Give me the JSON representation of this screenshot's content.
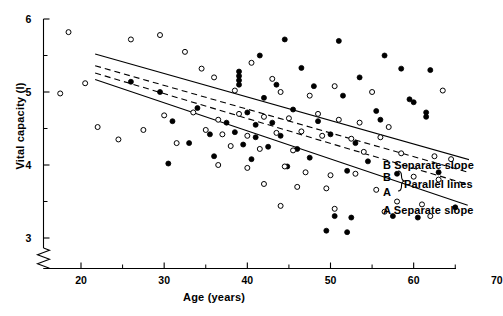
{
  "chart_data": {
    "type": "scatter",
    "title": "",
    "xlabel": "Age (years)",
    "ylabel": "Vital capacity (l)",
    "xlim": [
      15,
      70
    ],
    "ylim": [
      2.75,
      6
    ],
    "y_axis_break": true,
    "grid": false,
    "legend_position": "right-inside",
    "x_ticks_major": [
      20,
      30,
      40,
      50,
      60,
      70
    ],
    "x_ticks_minor": [
      25,
      35,
      45,
      55,
      65
    ],
    "x_tick_labels": [
      "20",
      "30",
      "40",
      "50",
      "60",
      "70"
    ],
    "y_ticks_major": [
      3,
      4,
      5,
      6
    ],
    "y_ticks_minor": [
      3.5,
      4.5,
      5.5
    ],
    "y_tick_labels": [
      "3",
      "4",
      "5",
      "6"
    ],
    "series": [
      {
        "name": "Group A",
        "marker": "filled-circle",
        "color": "#000000",
        "points": [
          [
            44.5,
            5.72
          ],
          [
            51.0,
            5.7
          ],
          [
            41.5,
            5.5
          ],
          [
            56.5,
            5.5
          ],
          [
            39.0,
            5.28
          ],
          [
            39.0,
            5.22
          ],
          [
            39.0,
            5.16
          ],
          [
            39.0,
            5.1
          ],
          [
            46.5,
            5.33
          ],
          [
            58.5,
            5.32
          ],
          [
            62.0,
            5.3
          ],
          [
            53.5,
            5.2
          ],
          [
            43.5,
            5.1
          ],
          [
            48.0,
            5.08
          ],
          [
            26.0,
            5.14
          ],
          [
            29.5,
            5.0
          ],
          [
            42.0,
            4.92
          ],
          [
            51.5,
            4.95
          ],
          [
            59.5,
            4.9
          ],
          [
            60.0,
            4.86
          ],
          [
            34.0,
            4.78
          ],
          [
            40.0,
            4.72
          ],
          [
            45.5,
            4.76
          ],
          [
            55.5,
            4.74
          ],
          [
            61.5,
            4.72
          ],
          [
            61.5,
            4.66
          ],
          [
            31.0,
            4.6
          ],
          [
            37.5,
            4.58
          ],
          [
            41.0,
            4.55
          ],
          [
            43.0,
            4.58
          ],
          [
            48.5,
            4.6
          ],
          [
            56.0,
            4.62
          ],
          [
            35.5,
            4.42
          ],
          [
            38.5,
            4.45
          ],
          [
            41.0,
            4.38
          ],
          [
            44.0,
            4.4
          ],
          [
            50.0,
            4.42
          ],
          [
            33.0,
            4.3
          ],
          [
            39.5,
            4.28
          ],
          [
            42.5,
            4.25
          ],
          [
            46.0,
            4.22
          ],
          [
            53.0,
            4.3
          ],
          [
            36.0,
            4.12
          ],
          [
            40.5,
            4.08
          ],
          [
            47.5,
            4.1
          ],
          [
            54.5,
            4.05
          ],
          [
            30.5,
            4.02
          ],
          [
            44.8,
            3.98
          ],
          [
            52.0,
            3.92
          ],
          [
            58.0,
            3.88
          ],
          [
            65.0,
            3.42
          ],
          [
            63.0,
            3.9
          ],
          [
            50.5,
            3.3
          ],
          [
            52.5,
            3.28
          ],
          [
            57.5,
            3.3
          ],
          [
            60.5,
            3.28
          ],
          [
            49.5,
            3.1
          ],
          [
            52.0,
            3.08
          ]
        ]
      },
      {
        "name": "Group B",
        "marker": "open-circle",
        "color": "#000000",
        "points": [
          [
            18.5,
            5.82
          ],
          [
            26.0,
            5.72
          ],
          [
            29.5,
            5.78
          ],
          [
            32.5,
            5.55
          ],
          [
            17.5,
            4.98
          ],
          [
            20.5,
            5.12
          ],
          [
            34.5,
            5.32
          ],
          [
            36.0,
            5.2
          ],
          [
            40.5,
            5.4
          ],
          [
            43.0,
            5.18
          ],
          [
            50.5,
            5.08
          ],
          [
            55.0,
            5.0
          ],
          [
            63.5,
            5.02
          ],
          [
            47.5,
            4.95
          ],
          [
            38.5,
            5.02
          ],
          [
            44.0,
            5.0
          ],
          [
            22.0,
            4.52
          ],
          [
            27.5,
            4.48
          ],
          [
            30.0,
            4.68
          ],
          [
            33.5,
            4.72
          ],
          [
            36.5,
            4.62
          ],
          [
            39.0,
            4.7
          ],
          [
            42.0,
            4.66
          ],
          [
            45.0,
            4.64
          ],
          [
            48.5,
            4.7
          ],
          [
            51.0,
            4.62
          ],
          [
            53.5,
            4.58
          ],
          [
            57.0,
            4.52
          ],
          [
            35.0,
            4.48
          ],
          [
            37.0,
            4.42
          ],
          [
            40.0,
            4.4
          ],
          [
            43.5,
            4.44
          ],
          [
            46.5,
            4.46
          ],
          [
            49.0,
            4.4
          ],
          [
            52.5,
            4.36
          ],
          [
            56.0,
            4.38
          ],
          [
            24.5,
            4.35
          ],
          [
            31.5,
            4.3
          ],
          [
            38.0,
            4.26
          ],
          [
            41.5,
            4.22
          ],
          [
            45.5,
            4.2
          ],
          [
            54.0,
            4.18
          ],
          [
            58.5,
            4.16
          ],
          [
            62.5,
            4.12
          ],
          [
            64.5,
            4.08
          ],
          [
            36.5,
            4.0
          ],
          [
            40.0,
            3.96
          ],
          [
            44.5,
            3.98
          ],
          [
            47.0,
            3.9
          ],
          [
            50.0,
            3.86
          ],
          [
            53.0,
            3.88
          ],
          [
            60.0,
            3.84
          ],
          [
            63.0,
            3.8
          ],
          [
            42.0,
            3.74
          ],
          [
            46.0,
            3.7
          ],
          [
            49.5,
            3.68
          ],
          [
            55.5,
            3.66
          ],
          [
            58.0,
            3.5
          ],
          [
            61.0,
            3.46
          ],
          [
            44.0,
            3.44
          ],
          [
            50.5,
            3.4
          ],
          [
            56.5,
            3.36
          ],
          [
            62.0,
            3.3
          ]
        ]
      }
    ],
    "fit_lines": [
      {
        "id": "b-separate-slope",
        "label": "B Separate slope",
        "style": "solid",
        "x_start": 21.7,
        "y_start": 5.52,
        "x_end": 68.0,
        "y_end": 4.03
      },
      {
        "id": "b-parallel",
        "label": "B",
        "style": "dashed",
        "x_start": 21.7,
        "y_start": 5.36,
        "x_end": 67.5,
        "y_end": 3.87
      },
      {
        "id": "a-parallel",
        "label": "A",
        "style": "dashed",
        "x_start": 21.7,
        "y_start": 5.26,
        "x_end": 67.5,
        "y_end": 3.7
      },
      {
        "id": "a-separate-slope",
        "label": "A Separate slope",
        "style": "solid",
        "x_start": 21.7,
        "y_start": 5.17,
        "x_end": 66.5,
        "y_end": 3.45
      }
    ],
    "annotations": [
      {
        "id": "legend-b-separate",
        "text": "B Separate slope"
      },
      {
        "id": "legend-b-parallel",
        "text": "B"
      },
      {
        "id": "legend-a-parallel",
        "text": "A"
      },
      {
        "id": "legend-brace-label",
        "text": "Parallel lines"
      },
      {
        "id": "legend-a-separate",
        "text": "A Separate slope"
      }
    ]
  }
}
